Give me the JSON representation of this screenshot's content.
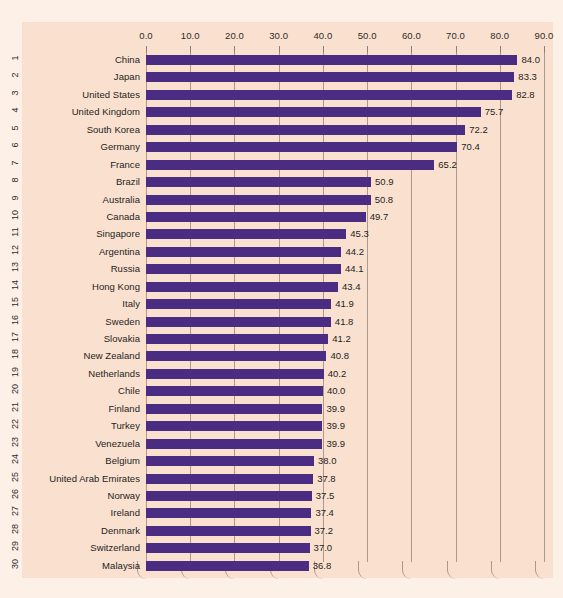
{
  "chart_data": {
    "type": "bar",
    "orientation": "horizontal",
    "title": "",
    "subtitle": "",
    "xlabel": "",
    "ylabel": "",
    "xlim": [
      0.0,
      90.0
    ],
    "xtick_step": 10.0,
    "xticks": [
      "0.0",
      "10.0",
      "20.0",
      "30.0",
      "40.0",
      "50.0",
      "60.0",
      "70.0",
      "80.0",
      "90.0"
    ],
    "xtick_values": [
      0.0,
      10.0,
      20.0,
      30.0,
      40.0,
      50.0,
      60.0,
      70.0,
      80.0,
      90.0
    ],
    "grid": true,
    "grid_axis": "x",
    "axis_position": "top",
    "legend": false,
    "legend_position": "none",
    "row_numbers": [
      "1",
      "2",
      "3",
      "4",
      "5",
      "6",
      "7",
      "8",
      "9",
      "10",
      "11",
      "12",
      "13",
      "14",
      "15",
      "16",
      "17",
      "18",
      "19",
      "20",
      "21",
      "22",
      "23",
      "24",
      "25",
      "26",
      "27",
      "28",
      "29",
      "30"
    ],
    "categories": [
      "China",
      "Japan",
      "United States",
      "United Kingdom",
      "South Korea",
      "Germany",
      "France",
      "Brazil",
      "Australia",
      "Canada",
      "Singapore",
      "Argentina",
      "Russia",
      "Hong Kong",
      "Italy",
      "Sweden",
      "Slovakia",
      "New Zealand",
      "Netherlands",
      "Chile",
      "Finland",
      "Turkey",
      "Venezuela",
      "Belgium",
      "United Arab Emirates",
      "Norway",
      "Ireland",
      "Denmark",
      "Switzerland",
      "Malaysia"
    ],
    "values": [
      84.0,
      83.3,
      82.8,
      75.7,
      72.2,
      70.4,
      65.2,
      50.9,
      50.8,
      49.7,
      45.3,
      44.2,
      44.1,
      43.4,
      41.9,
      41.8,
      41.2,
      40.8,
      40.2,
      40.0,
      39.9,
      39.9,
      39.9,
      38.0,
      37.8,
      37.5,
      37.4,
      37.2,
      37.0,
      36.8
    ],
    "value_labels": [
      "84.0",
      "83.3",
      "82.8",
      "75.7",
      "72.2",
      "70.4",
      "65.2",
      "50.9",
      "50.8",
      "49.7",
      "45.3",
      "44.2",
      "44.1",
      "43.4",
      "41.9",
      "41.8",
      "41.2",
      "40.8",
      "40.2",
      "40.0",
      "39.9",
      "39.9",
      "39.9",
      "38.0",
      "37.8",
      "37.5",
      "37.4",
      "37.2",
      "37.0",
      "36.8"
    ]
  },
  "colors": {
    "bar": "#4a2d82",
    "panel_background": "#fae1cf",
    "canvas_background": "#fdf1e7",
    "gridline": "#9c8c83",
    "text": "#1d1d1d"
  }
}
